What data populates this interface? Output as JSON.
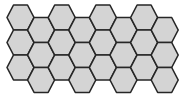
{
  "diagram": {
    "type": "hexagonal-grid",
    "orientation": "flat-top",
    "columns": 8,
    "rows_per_column": 3,
    "total_cells": 24,
    "fill_color": "#d4d4d4",
    "stroke_color": "#262626",
    "background_color": "#ffffff"
  }
}
